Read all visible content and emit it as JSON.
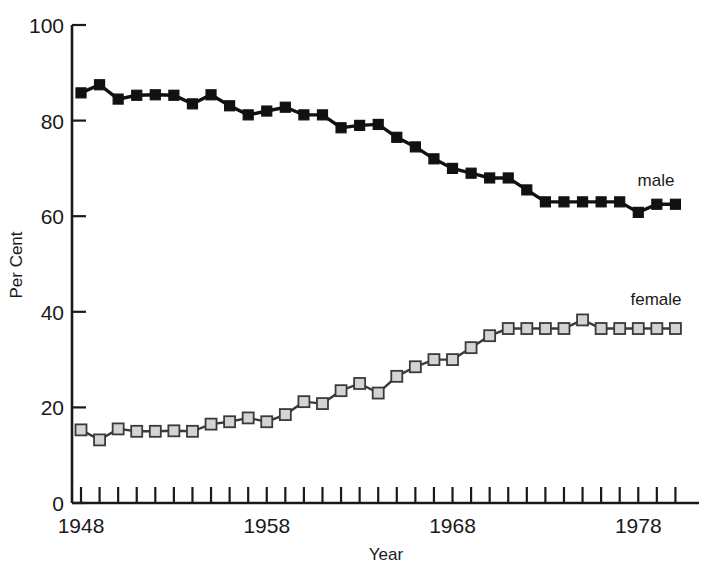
{
  "chart_data": {
    "type": "line",
    "title": "",
    "xlabel": "Year",
    "ylabel": "Per Cent",
    "xlim": [
      1948,
      1980
    ],
    "ylim": [
      0,
      100
    ],
    "grid": false,
    "legend_position": "inline-right",
    "xticks": [
      1948,
      1958,
      1968,
      1978
    ],
    "xtick_labels": [
      "1948",
      "1958",
      "1968",
      "1978"
    ],
    "yticks": [
      0,
      20,
      40,
      60,
      80,
      100
    ],
    "ytick_labels": [
      "0",
      "20",
      "40",
      "60",
      "80",
      "100"
    ],
    "x": [
      1948,
      1949,
      1950,
      1951,
      1952,
      1953,
      1954,
      1955,
      1956,
      1957,
      1958,
      1959,
      1960,
      1961,
      1962,
      1963,
      1964,
      1965,
      1966,
      1967,
      1968,
      1969,
      1970,
      1971,
      1972,
      1973,
      1974,
      1975,
      1976,
      1977,
      1978,
      1979,
      1980
    ],
    "series": [
      {
        "name": "male",
        "label": "male",
        "marker": "filled-square",
        "color": "#111111",
        "marker_fill": "#111111",
        "values": [
          85.8,
          87.5,
          84.5,
          85.3,
          85.4,
          85.3,
          83.5,
          85.4,
          83.1,
          81.2,
          82.0,
          82.8,
          81.2,
          81.2,
          78.5,
          79.0,
          79.2,
          76.5,
          74.5,
          72.0,
          70.0,
          69.0,
          68.0,
          68.0,
          65.5,
          63.0,
          63.0,
          63.0,
          63.0,
          63.0,
          60.8,
          62.5,
          62.5
        ]
      },
      {
        "name": "female",
        "label": "female",
        "marker": "open-square",
        "color": "#3a3a3a",
        "marker_fill": "#d4d4d4",
        "values": [
          15.3,
          13.2,
          15.5,
          15.0,
          15.0,
          15.1,
          15.0,
          16.5,
          17.0,
          17.8,
          17.0,
          18.5,
          21.2,
          20.8,
          23.5,
          25.0,
          23.0,
          26.5,
          28.5,
          30.0,
          30.0,
          32.5,
          35.0,
          36.5,
          36.5,
          36.5,
          36.5,
          38.3,
          36.5,
          36.5,
          36.5,
          36.5,
          36.5
        ]
      }
    ]
  },
  "axes": {
    "y_axis_title": "Per Cent",
    "x_axis_title": "Year"
  },
  "labels": {
    "male": "male",
    "female": "female"
  }
}
